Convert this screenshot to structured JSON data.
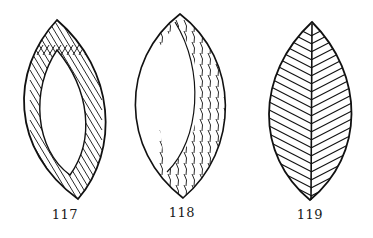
{
  "figures": [
    {
      "id": "117",
      "label": "117",
      "description": "leaf outline filled with a band of stitches around the border, hollow center"
    },
    {
      "id": "118",
      "label": "118",
      "description": "leaf with crescent band of stitches on the right side, left side unfilled"
    },
    {
      "id": "119",
      "label": "119",
      "description": "leaf filled with herringbone diagonal lines and central midrib"
    }
  ],
  "colors": {
    "ink": "#111111",
    "paper": "#ffffff"
  }
}
